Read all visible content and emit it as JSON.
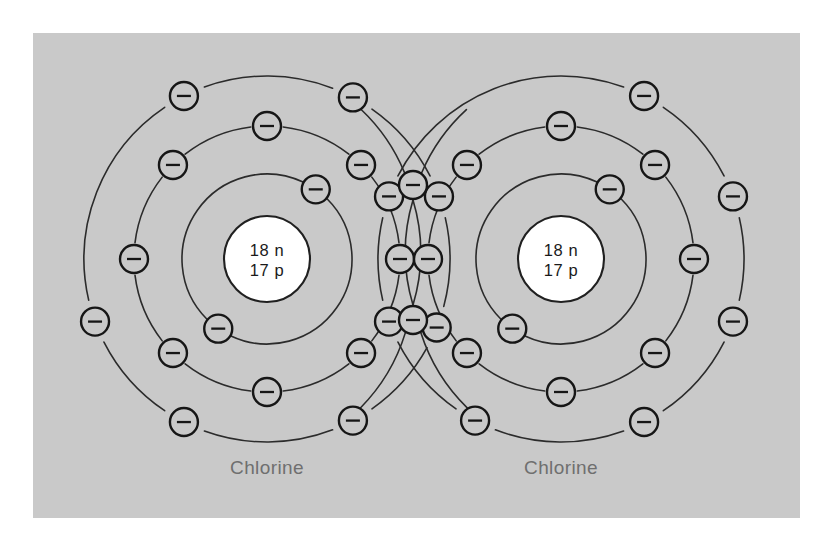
{
  "figure": {
    "background_color": "#ffffff",
    "panel_color": "#c9c9c9",
    "panel": {
      "x": 33,
      "y": 33,
      "width": 767,
      "height": 485
    },
    "line_color": "#2b2b2b",
    "electron_stroke_color": "#161616",
    "nucleus_fill_color": "#ffffff",
    "caption_color": "#6f6f6f"
  },
  "chart_data": {
    "type": "diagram",
    "element_symbol": "Cl",
    "atoms": [
      {
        "name": "left-chlorine-atom",
        "label": "Chlorine",
        "center": {
          "x": 267,
          "y": 259
        },
        "nucleus": {
          "radius": 43,
          "line1": "18 n",
          "line2": "17 p",
          "neutrons": 18,
          "protons": 17
        },
        "shells": [
          {
            "name": "inner-shell",
            "radius": 85,
            "electron_count": 2,
            "angles": [
              -55,
              125
            ]
          },
          {
            "name": "middle-shell",
            "radius": 133,
            "electron_count": 8,
            "angles": [
              -90,
              -45,
              0,
              45,
              90,
              135,
              180,
              225
            ]
          },
          {
            "name": "outer-shell",
            "radius": 183,
            "electron_count": 7,
            "angles": [
              -117,
              -62,
              -20,
              22,
              62,
              117,
              160
            ]
          }
        ],
        "caption_position": {
          "x": 267,
          "y": 474
        }
      },
      {
        "name": "right-chlorine-atom",
        "label": "Chlorine",
        "center": {
          "x": 561,
          "y": 259
        },
        "nucleus": {
          "radius": 43,
          "line1": "18 n",
          "line2": "17 p",
          "neutrons": 18,
          "protons": 17
        },
        "shells": [
          {
            "name": "inner-shell",
            "radius": 85,
            "electron_count": 2,
            "angles": [
              -55,
              125
            ]
          },
          {
            "name": "middle-shell",
            "radius": 133,
            "electron_count": 8,
            "angles": [
              -90,
              -45,
              0,
              45,
              90,
              135,
              180,
              225
            ]
          },
          {
            "name": "outer-shell",
            "radius": 183,
            "electron_count": 7,
            "angles": [
              -63,
              -20,
              20,
              63,
              118,
              160,
              200
            ]
          }
        ],
        "caption_position": {
          "x": 561,
          "y": 474
        }
      }
    ],
    "shared_electrons": [
      {
        "name": "shared-electron-top",
        "x": 413,
        "y": 185
      },
      {
        "name": "shared-electron-bottom",
        "x": 413,
        "y": 320
      }
    ],
    "electron": {
      "symbol": "−",
      "charge": "negative",
      "radius": 14,
      "bar_half_width": 7
    },
    "totals": {
      "electrons_per_atom": 17,
      "shared_electron_pairs": 1,
      "bond_type": "covalent"
    }
  }
}
